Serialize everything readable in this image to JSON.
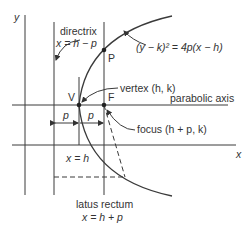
{
  "axes": {
    "x_label": "x",
    "y_label": "y"
  },
  "labels": {
    "directrix_title": "directrix",
    "directrix_eq": "x = h − p",
    "point_p": "P",
    "equation": "(y − k)² = 4p(x − h)",
    "vertex": "vertex (h, k)",
    "vertex_letter": "V",
    "focus_letter": "F",
    "parabolic_axis": "parabolic axis",
    "focus": "focus (h + p, k)",
    "p_left": "p",
    "p_right": "p",
    "vertex_line_eq": "x = h",
    "latus_rectum_title": "latus rectum",
    "latus_rectum_eq": "x = h + p"
  },
  "colors": {
    "line": "#3a3a3a",
    "background": "#ffffff"
  }
}
